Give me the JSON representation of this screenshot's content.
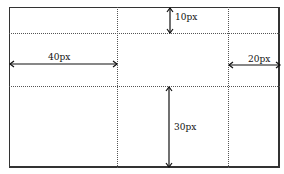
{
  "diagram": {
    "labels": {
      "top": "10px",
      "left": "40px",
      "right": "20px",
      "bottom": "30px"
    },
    "colors": {
      "line": "#333333",
      "dotted": "#555555"
    }
  }
}
